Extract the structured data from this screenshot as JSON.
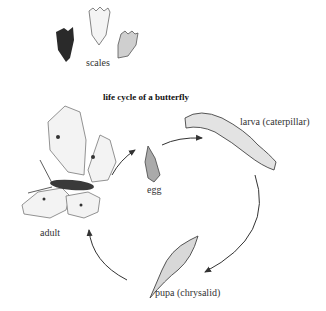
{
  "diagram": {
    "title": "life cycle of a butterfly",
    "scales_label": "scales",
    "stages": [
      {
        "id": "egg",
        "label": "egg"
      },
      {
        "id": "larva",
        "label": "larva (caterpillar)"
      },
      {
        "id": "pupa",
        "label": "pupa (chrysalid)"
      },
      {
        "id": "adult",
        "label": "adult"
      }
    ],
    "cycle_order": [
      "adult",
      "egg",
      "larva",
      "pupa",
      "adult"
    ]
  }
}
